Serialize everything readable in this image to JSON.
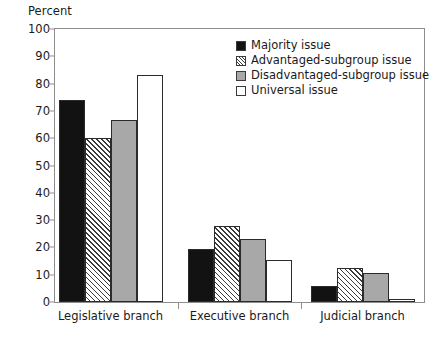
{
  "chart_data": {
    "type": "bar",
    "title": "",
    "subtitle": "",
    "xlabel": "",
    "ylabel": "Percent",
    "ylim": [
      0,
      100
    ],
    "yticks": [
      0,
      10,
      20,
      30,
      40,
      50,
      60,
      70,
      80,
      90,
      100
    ],
    "grid": false,
    "legend_position": "top-right",
    "categories": [
      "Legislative branch",
      "Executive branch",
      "Judicial branch"
    ],
    "series": [
      {
        "name": "Majority issue",
        "values": [
          74,
          19.5,
          6
        ],
        "fill": "#121212",
        "pattern": "solid"
      },
      {
        "name": "Advantaged-subgroup issue",
        "values": [
          60,
          28,
          12.5
        ],
        "fill": "#ffffff",
        "pattern": "diagonal-hatch"
      },
      {
        "name": "Disadvantaged-subgroup issue",
        "values": [
          66.5,
          23,
          10.5
        ],
        "fill": "#a8a8a8",
        "pattern": "solid"
      },
      {
        "name": "Universal issue",
        "values": [
          83,
          15.5,
          1
        ],
        "fill": "#ffffff",
        "pattern": "solid"
      }
    ]
  },
  "colors": {
    "axis": "#8d8d8d",
    "text": "#1a1a1a",
    "bar_border": "#2b2b2b",
    "majority": "#121212",
    "disadvantaged": "#a8a8a8",
    "universal": "#ffffff",
    "hatch_line": "#3a3a3a"
  }
}
